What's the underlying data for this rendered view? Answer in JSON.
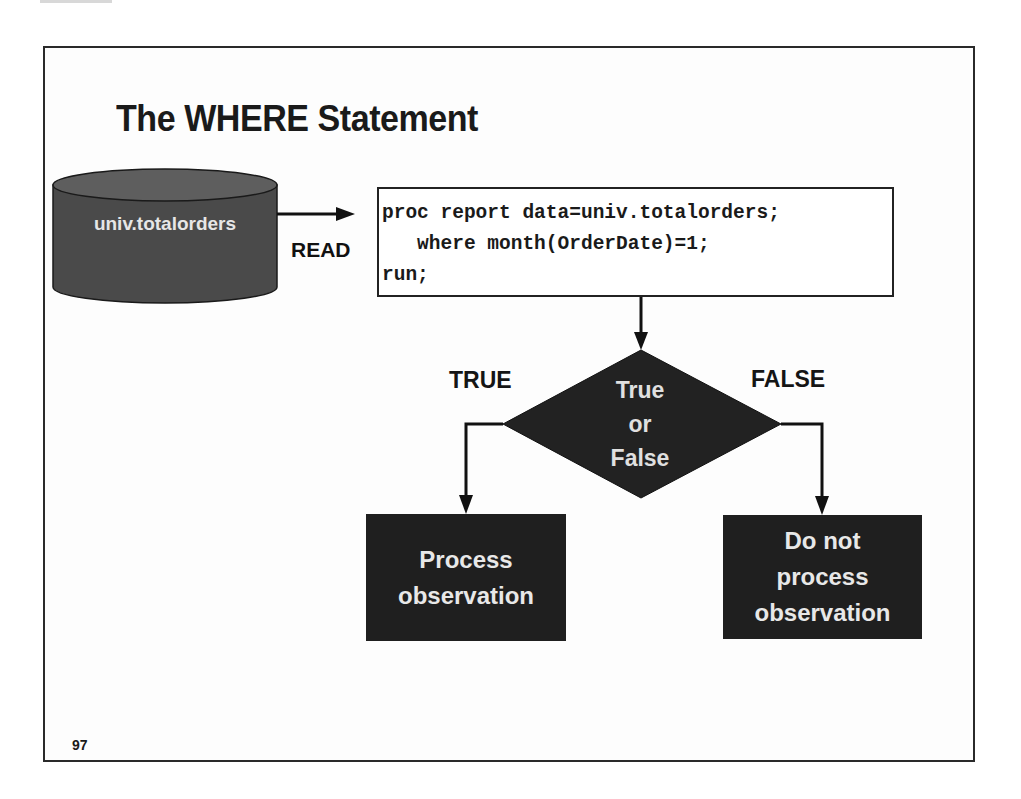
{
  "slide": {
    "title": "The WHERE Statement",
    "page_number": "97"
  },
  "data_source": {
    "name": "univ.totalorders",
    "shape": "cylinder-icon",
    "arrow_label": "READ"
  },
  "code": {
    "lines": [
      "proc report data=univ.totalorders;",
      "   where month(OrderDate)=1;",
      "run;"
    ]
  },
  "decision": {
    "line1": "True",
    "line2": "or",
    "line3": "False",
    "true_branch_label": "TRUE",
    "false_branch_label": "FALSE"
  },
  "outcomes": {
    "true_box": {
      "line1": "Process",
      "line2": "observation"
    },
    "false_box": {
      "line1": "Do not",
      "line2": "process",
      "line3": "observation"
    }
  },
  "colors": {
    "shape_fill": "#1f1f1f",
    "cylinder_fill": "#4a4a4a",
    "cylinder_top": "#5e5e5e",
    "text_dark": "#1a1a1a",
    "text_light": "#e6e6e6"
  }
}
